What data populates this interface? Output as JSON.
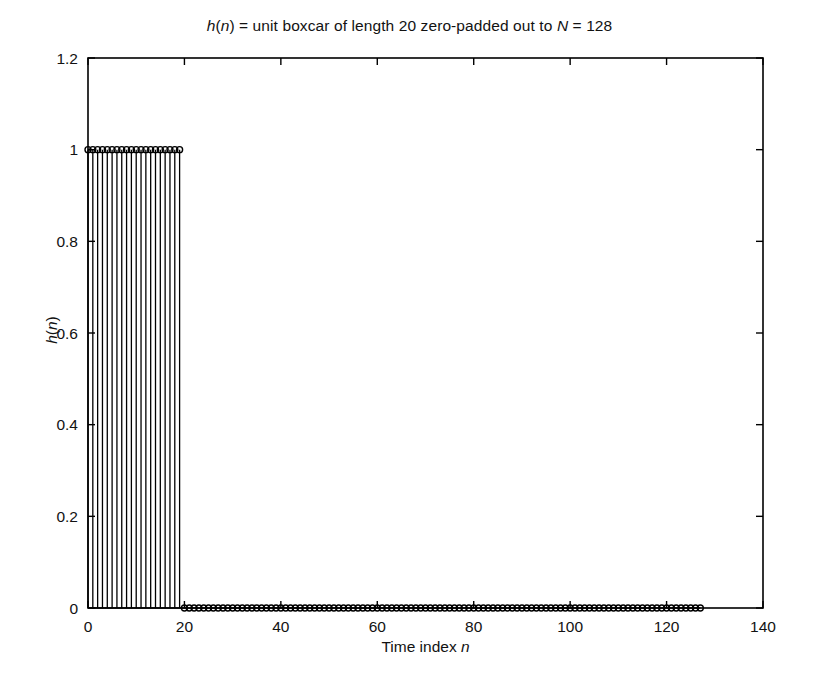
{
  "figure": {
    "background_color": "#ffffff",
    "line_color": "#000000",
    "title_parts": [
      {
        "text": "h",
        "italic": true
      },
      {
        "text": "(",
        "italic": false
      },
      {
        "text": "n",
        "italic": true
      },
      {
        "text": ") = unit boxcar of length 20 zero-padded out to ",
        "italic": false
      },
      {
        "text": "N",
        "italic": true
      },
      {
        "text": " = 128",
        "italic": false
      }
    ],
    "title_plain": "h(n) = unit boxcar of length 20 zero-padded out to N = 128",
    "ylabel_parts": [
      {
        "text": "h",
        "italic": true
      },
      {
        "text": "(",
        "italic": false
      },
      {
        "text": "n",
        "italic": true
      },
      {
        "text": ")",
        "italic": false
      }
    ],
    "ylabel_plain": "h(n)",
    "xlabel_parts": [
      {
        "text": "Time index ",
        "italic": false
      },
      {
        "text": "n",
        "italic": true
      }
    ],
    "xlabel_plain": "Time index n"
  },
  "chart_data": {
    "type": "stem",
    "title": "h(n) = unit boxcar of length 20 zero-padded out to N = 128",
    "xlabel": "Time index n",
    "ylabel": "h(n)",
    "xlim": [
      0,
      140
    ],
    "ylim": [
      0,
      1.2
    ],
    "xticks": [
      0,
      20,
      40,
      60,
      80,
      100,
      120,
      140
    ],
    "xtick_labels": [
      "0",
      "20",
      "40",
      "60",
      "80",
      "100",
      "120",
      "140"
    ],
    "yticks": [
      0,
      0.2,
      0.4,
      0.6,
      0.8,
      1,
      1.2
    ],
    "ytick_labels": [
      "0",
      "0.2",
      "0.4",
      "0.6",
      "0.8",
      "1",
      "1.2"
    ],
    "grid": false,
    "legend": null,
    "marker": "circle-open",
    "marker_size_px": 6,
    "series": [
      {
        "name": "h(n)",
        "description": "unit boxcar of length 20, zero-padded to N = 128",
        "boxcar_length": 20,
        "N": 128,
        "x": [
          0,
          1,
          2,
          3,
          4,
          5,
          6,
          7,
          8,
          9,
          10,
          11,
          12,
          13,
          14,
          15,
          16,
          17,
          18,
          19,
          20,
          21,
          22,
          23,
          24,
          25,
          26,
          27,
          28,
          29,
          30,
          31,
          32,
          33,
          34,
          35,
          36,
          37,
          38,
          39,
          40,
          41,
          42,
          43,
          44,
          45,
          46,
          47,
          48,
          49,
          50,
          51,
          52,
          53,
          54,
          55,
          56,
          57,
          58,
          59,
          60,
          61,
          62,
          63,
          64,
          65,
          66,
          67,
          68,
          69,
          70,
          71,
          72,
          73,
          74,
          75,
          76,
          77,
          78,
          79,
          80,
          81,
          82,
          83,
          84,
          85,
          86,
          87,
          88,
          89,
          90,
          91,
          92,
          93,
          94,
          95,
          96,
          97,
          98,
          99,
          100,
          101,
          102,
          103,
          104,
          105,
          106,
          107,
          108,
          109,
          110,
          111,
          112,
          113,
          114,
          115,
          116,
          117,
          118,
          119,
          120,
          121,
          122,
          123,
          124,
          125,
          126,
          127
        ],
        "values": [
          1,
          1,
          1,
          1,
          1,
          1,
          1,
          1,
          1,
          1,
          1,
          1,
          1,
          1,
          1,
          1,
          1,
          1,
          1,
          1,
          0,
          0,
          0,
          0,
          0,
          0,
          0,
          0,
          0,
          0,
          0,
          0,
          0,
          0,
          0,
          0,
          0,
          0,
          0,
          0,
          0,
          0,
          0,
          0,
          0,
          0,
          0,
          0,
          0,
          0,
          0,
          0,
          0,
          0,
          0,
          0,
          0,
          0,
          0,
          0,
          0,
          0,
          0,
          0,
          0,
          0,
          0,
          0,
          0,
          0,
          0,
          0,
          0,
          0,
          0,
          0,
          0,
          0,
          0,
          0,
          0,
          0,
          0,
          0,
          0,
          0,
          0,
          0,
          0,
          0,
          0,
          0,
          0,
          0,
          0,
          0,
          0,
          0,
          0,
          0,
          0,
          0,
          0,
          0,
          0,
          0,
          0,
          0,
          0,
          0,
          0,
          0,
          0,
          0,
          0,
          0,
          0,
          0,
          0,
          0,
          0,
          0,
          0,
          0,
          0,
          0,
          0,
          0
        ]
      }
    ]
  }
}
